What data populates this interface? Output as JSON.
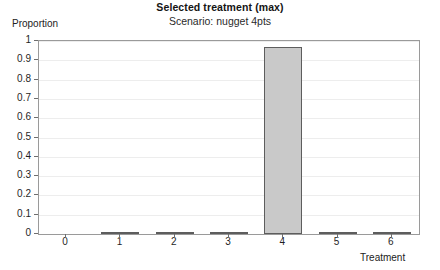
{
  "chart_data": {
    "type": "bar",
    "title": "Selected treatment (max)",
    "subtitle": "Scenario: nugget 4pts",
    "xlabel": "Treatment",
    "ylabel": "Proportion",
    "categories": [
      "0",
      "1",
      "2",
      "3",
      "4",
      "5",
      "6"
    ],
    "values": [
      0,
      0.008,
      0.006,
      0.006,
      0.97,
      0.006,
      0.006
    ],
    "ylim": [
      0,
      1
    ],
    "ytick_labels": [
      "0",
      "0.1",
      "0.2",
      "0.3",
      "0.4",
      "0.5",
      "0.6",
      "0.7",
      "0.8",
      "0.9",
      "1"
    ],
    "ytick_values": [
      0,
      0.1,
      0.2,
      0.3,
      0.4,
      0.5,
      0.6,
      0.7,
      0.8,
      0.9,
      1
    ],
    "grid": true,
    "legend": "none",
    "bar_fill_color": "#c9c9c9",
    "bar_border_color": "#5d5d5d",
    "panel_border_color": "#9a9a9a",
    "gridline_color": "#ededed"
  }
}
